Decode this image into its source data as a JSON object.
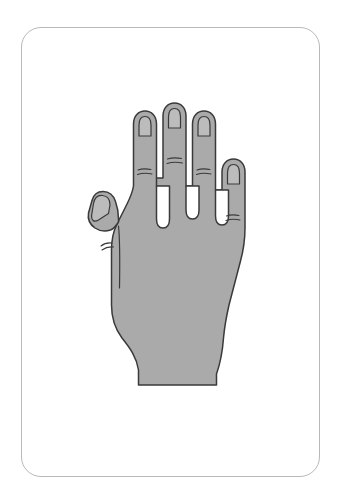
{
  "card": {
    "name": "hand-illustration-flashcard",
    "background_color": "#ffffff",
    "border_color": "#b9b9b9",
    "border_radius_px": 20,
    "frame": {
      "x": 21,
      "y": 27,
      "width": 299,
      "height": 450
    }
  },
  "illustration": {
    "subject": "hand",
    "view": "dorsal-back-of-hand",
    "orientation": "fingers-up",
    "hand_side": "left",
    "fill_color": "#aaaaaa",
    "outline_color": "#3a3a3a",
    "nail_fill_color": "#bcbcbc",
    "crease_color": "#3a3a3a",
    "parts": [
      {
        "name": "thumb",
        "has_nail": true,
        "crease_count": 1
      },
      {
        "name": "index-finger",
        "has_nail": true,
        "crease_count": 1
      },
      {
        "name": "middle-finger",
        "has_nail": true,
        "crease_count": 1
      },
      {
        "name": "ring-finger",
        "has_nail": true,
        "crease_count": 1
      },
      {
        "name": "pinky-finger",
        "has_nail": true,
        "crease_count": 1
      },
      {
        "name": "palm-back",
        "has_nail": false,
        "crease_count": 0
      },
      {
        "name": "wrist",
        "has_nail": false,
        "crease_count": 0
      }
    ],
    "finger_count": 5,
    "nail_count": 5
  }
}
